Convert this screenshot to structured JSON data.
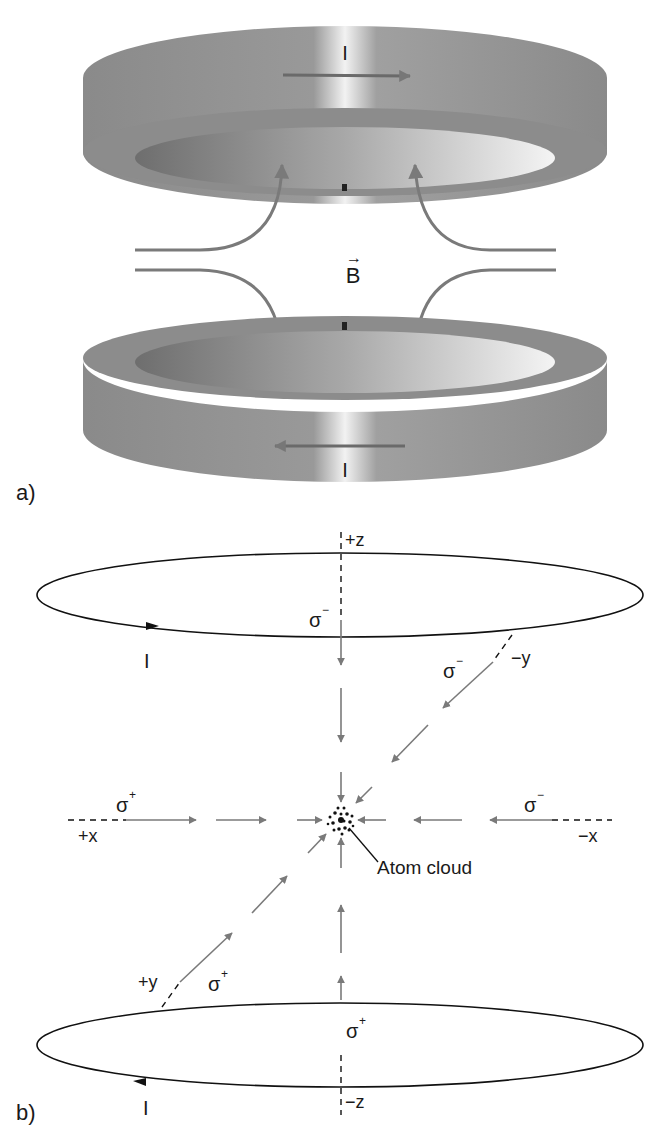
{
  "panel_a": {
    "label": "a)",
    "top_coil_current": "I",
    "bottom_coil_current": "I",
    "field_label": "B",
    "field_vector_arrow": "→"
  },
  "panel_b": {
    "label": "b)",
    "axes": {
      "plus_z": "+z",
      "minus_z": "−z",
      "plus_x": "+x",
      "minus_x": "−x",
      "plus_y": "+y",
      "minus_y": "−y"
    },
    "top_loop_current": "I",
    "bottom_loop_current": "I",
    "beams": {
      "from_plus_z": {
        "sigma": "σ",
        "sup": "−"
      },
      "from_minus_y": {
        "sigma": "σ",
        "sup": "−"
      },
      "from_plus_x": {
        "sigma": "σ",
        "sup": "+"
      },
      "from_minus_x": {
        "sigma": "σ",
        "sup": "−"
      },
      "from_plus_y": {
        "sigma": "σ",
        "sup": "+"
      },
      "from_minus_z": {
        "sigma": "σ",
        "sup": "+"
      }
    },
    "center_label": "Atom cloud"
  },
  "colors": {
    "coil_gray": "#8e8e8e",
    "coil_dark": "#6a6a6a",
    "arrow_gray": "#7a7a7a",
    "line_black": "#111111"
  }
}
